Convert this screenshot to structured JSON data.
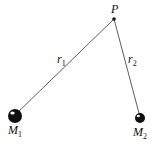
{
  "diagram": {
    "title": "",
    "colors": {
      "ink": "#111111",
      "line": "#333333",
      "highlight": "#ffffff"
    },
    "nodes": [
      {
        "id": "P",
        "label": "P",
        "subscript": "",
        "kind": "point"
      },
      {
        "id": "M1",
        "label": "M",
        "subscript": "1",
        "kind": "mass-large"
      },
      {
        "id": "M2",
        "label": "M",
        "subscript": "2",
        "kind": "mass-small"
      }
    ],
    "edges": [
      {
        "from": "M1",
        "to": "P",
        "label": "r",
        "subscript": "1"
      },
      {
        "from": "M2",
        "to": "P",
        "label": "r",
        "subscript": "2"
      }
    ]
  }
}
